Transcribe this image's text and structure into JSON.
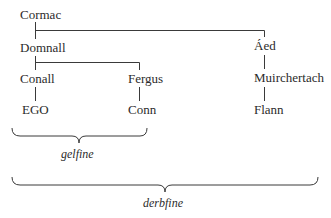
{
  "diagram": {
    "type": "genealogy-tree",
    "nodes": {
      "cormac": "Cormac",
      "domnall": "Domnall",
      "aed": "Áed",
      "conall": "Conall",
      "fergus": "Fergus",
      "muirchertach": "Muirchertach",
      "ego": "EGO",
      "conn": "Conn",
      "flann": "Flann"
    },
    "edges": [
      [
        "Cormac",
        "Domnall"
      ],
      [
        "Cormac",
        "Áed"
      ],
      [
        "Domnall",
        "Conall"
      ],
      [
        "Domnall",
        "Fergus"
      ],
      [
        "Conall",
        "EGO"
      ],
      [
        "Fergus",
        "Conn"
      ],
      [
        "Áed",
        "Muirchertach"
      ],
      [
        "Muirchertach",
        "Flann"
      ]
    ],
    "groups": {
      "gelfine": {
        "label": "gelfine",
        "members": [
          "EGO",
          "Conn"
        ]
      },
      "derbfine": {
        "label": "derbfine",
        "members": [
          "EGO",
          "Conn",
          "Flann"
        ]
      }
    },
    "colors": {
      "line": "#3a3a3a",
      "text": "#2b2b2b",
      "background": "#ffffff"
    }
  }
}
